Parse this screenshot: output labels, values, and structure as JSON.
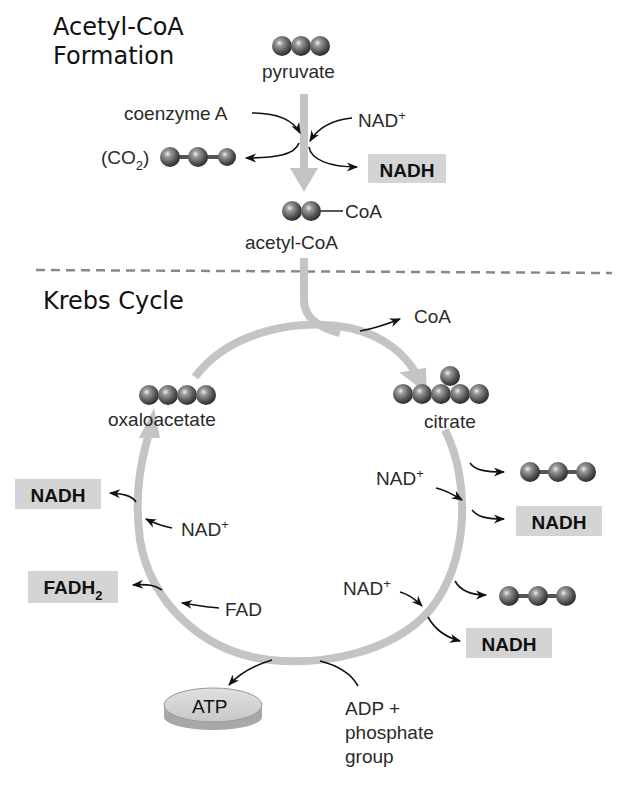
{
  "sections": {
    "acetyl_coa_title_line1": "Acetyl-CoA",
    "acetyl_coa_title_line2": "Formation",
    "krebs_title": "Krebs Cycle"
  },
  "acetyl_coa_formation": {
    "input": "pyruvate",
    "coenzyme": "coenzyme A",
    "nad_base": "NAD",
    "nad_sup": "+",
    "co2_prefix": "(CO",
    "co2_sub": "2",
    "co2_suffix": ")",
    "nadh": "NADH",
    "coa_tag": "CoA",
    "output": "acetyl-CoA"
  },
  "krebs_cycle": {
    "coa_release": "CoA",
    "oxaloacetate": "oxaloacetate",
    "citrate": "citrate",
    "right_nad_1_base": "NAD",
    "right_nad_1_sup": "+",
    "right_nadh_1": "NADH",
    "right_nad_2_base": "NAD",
    "right_nad_2_sup": "+",
    "right_nadh_2": "NADH",
    "left_nadh": "NADH",
    "left_nad_base": "NAD",
    "left_nad_sup": "+",
    "fadh2_base": "FADH",
    "fadh2_sub": "2",
    "fad": "FAD",
    "atp": "ATP",
    "adp_line1": "ADP +",
    "adp_line2": "phosphate",
    "adp_line3": "group"
  },
  "colors": {
    "pathway_gray": "#c4c4c4",
    "label_box": "#d4d4d4",
    "dashed_divider": "#888888",
    "molecule_dark": "#555555"
  }
}
